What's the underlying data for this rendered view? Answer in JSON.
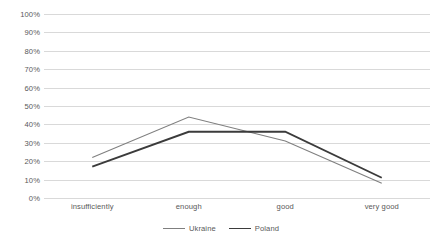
{
  "chart_data": {
    "type": "line",
    "title": "",
    "subtitle": "",
    "xlabel": "",
    "ylabel": "",
    "categories": [
      "insufficiently",
      "enough",
      "good",
      "very good"
    ],
    "series": [
      {
        "name": "Ukraine",
        "values": [
          22,
          44,
          31,
          8
        ],
        "color": "#7f7f7f",
        "width": 1.1
      },
      {
        "name": "Poland",
        "values": [
          17,
          36,
          36,
          11
        ],
        "color": "#3b3b3b",
        "width": 1.9
      }
    ],
    "ylim": [
      0,
      100
    ],
    "ytick_step": 10,
    "ytick_labels": [
      "100%",
      "90%",
      "80%",
      "70%",
      "60%",
      "50%",
      "40%",
      "30%",
      "20%",
      "10%",
      "0%"
    ],
    "ytick_values": [
      100,
      90,
      80,
      70,
      60,
      50,
      40,
      30,
      20,
      10,
      0
    ],
    "grid": true,
    "grid_color": "#d9d9d9",
    "legend_position": "bottom",
    "background_color": "#ffffff",
    "text_color": "#595959"
  }
}
